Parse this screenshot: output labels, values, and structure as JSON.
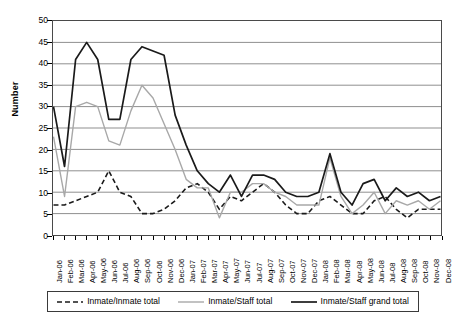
{
  "axis": {
    "ylabel": "Number",
    "yticks": [
      "0",
      "5",
      "10",
      "15",
      "20",
      "25",
      "30",
      "35",
      "40",
      "45",
      "50"
    ]
  },
  "legend": {
    "items": [
      {
        "label": "Inmate/Inmate total",
        "style": "dashed",
        "color": "#1a1a1a"
      },
      {
        "label": "Inmate/Staff total",
        "style": "solid",
        "color": "#a8a8a8"
      },
      {
        "label": "Inmate/Staff grand total",
        "style": "solid",
        "color": "#1a1a1a"
      }
    ]
  },
  "chart_data": {
    "type": "line",
    "title": "",
    "xlabel": "",
    "ylabel": "Number",
    "ylim": [
      0,
      50
    ],
    "ytick_step": 5,
    "grid": true,
    "legend_position": "bottom",
    "categories": [
      "Jan-06",
      "Feb-06",
      "Mar-06",
      "Apr-06",
      "May-06",
      "Jun-06",
      "Jul-06",
      "Aug-06",
      "Sep-06",
      "Oct-06",
      "Nov-06",
      "Dec-06",
      "Jan-07",
      "Feb-07",
      "Mar-07",
      "Apr-07",
      "May-07",
      "Jun-07",
      "Jul-07",
      "Aug-07",
      "Sep-07",
      "Oct-07",
      "Nov-07",
      "Dec-07",
      "Jan-08",
      "Feb-08",
      "Mar-08",
      "Apr-08",
      "May-08",
      "Jun-08",
      "Jul-08",
      "Aug-08",
      "Sep-08",
      "Oct-08",
      "Nov-08",
      "Dec-08"
    ],
    "series": [
      {
        "name": "Inmate/Inmate total",
        "color": "#1a1a1a",
        "style": "dashed",
        "values": [
          7,
          7,
          8,
          9,
          10,
          15,
          10,
          9,
          5,
          5,
          6,
          8,
          11,
          12,
          10,
          6,
          9,
          8,
          10,
          12,
          10,
          7,
          5,
          5,
          8,
          9,
          7,
          5,
          5,
          8,
          9,
          6,
          4,
          6,
          6,
          6
        ]
      },
      {
        "name": "Inmate/Staff total",
        "color": "#a8a8a8",
        "style": "solid",
        "values": [
          23,
          9,
          30,
          31,
          30,
          22,
          21,
          29,
          35,
          32,
          26,
          20,
          13,
          11,
          11,
          4,
          10,
          10,
          12,
          12,
          10,
          9,
          7,
          7,
          7,
          18,
          9,
          5,
          7,
          10,
          5,
          8,
          7,
          8,
          6,
          8
        ]
      },
      {
        "name": "Inmate/Staff grand total",
        "color": "#1a1a1a",
        "style": "solid",
        "values": [
          30,
          16,
          41,
          45,
          41,
          27,
          27,
          41,
          44,
          43,
          42,
          28,
          21,
          15,
          12,
          10,
          14,
          9,
          14,
          14,
          13,
          10,
          9,
          9,
          10,
          19,
          10,
          7,
          12,
          13,
          8,
          11,
          9,
          10,
          8,
          9
        ]
      }
    ]
  }
}
